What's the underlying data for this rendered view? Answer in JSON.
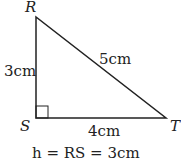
{
  "diagram": {
    "type": "right-triangle",
    "vertices": {
      "R": {
        "label": "R"
      },
      "S": {
        "label": "S"
      },
      "T": {
        "label": "T"
      }
    },
    "sides": {
      "RS": "3cm",
      "RT": "5cm",
      "ST": "4cm"
    },
    "right_angle_at": "S",
    "caption": "h = RS = 3cm"
  }
}
